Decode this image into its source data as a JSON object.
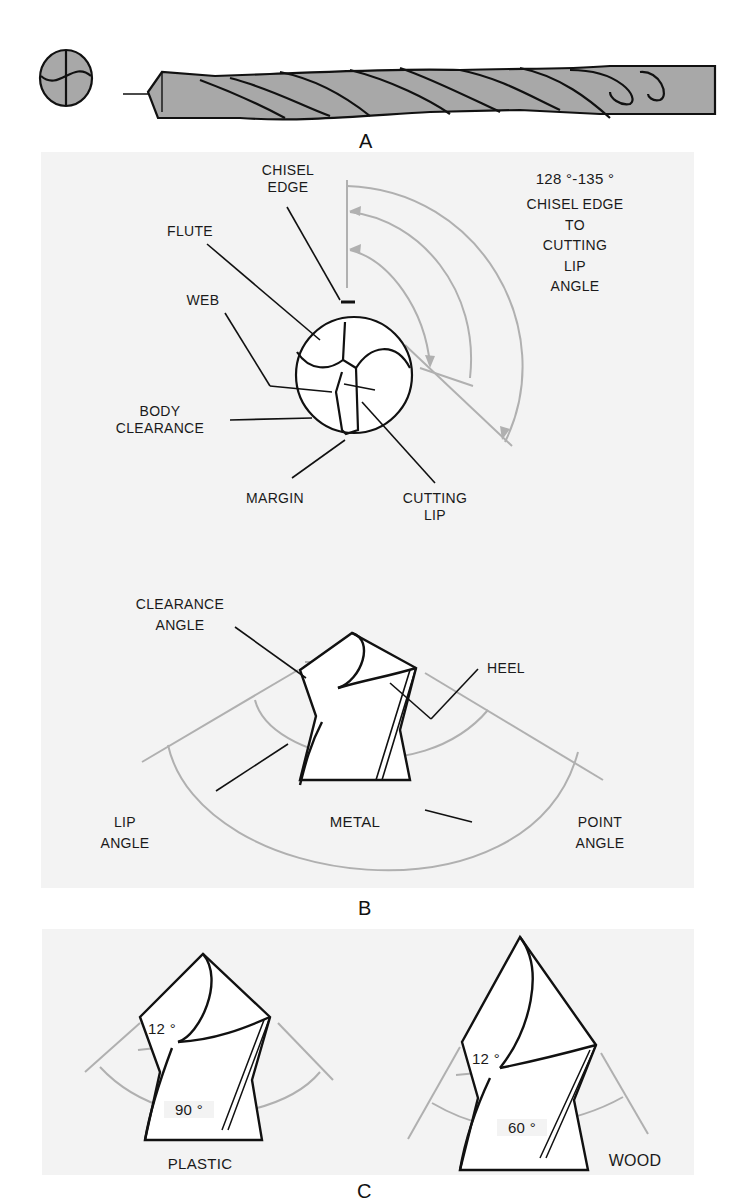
{
  "figure_labels": {
    "a": "A",
    "b": "B",
    "c": "C"
  },
  "panel_b": {
    "end_view": {
      "chisel_edge": "CHISEL\nEDGE",
      "flute": "FLUTE",
      "web": "WEB",
      "body_clearance": "BODY\nCLEARANCE",
      "margin": "MARGIN",
      "cutting_lip": "CUTTING\nLIP",
      "angle_range": "128 °-135 °",
      "angle_caption": "CHISEL EDGE\nTO\nCUTTING\nLIP\nANGLE"
    },
    "side_view": {
      "clearance_angle": "CLEARANCE\nANGLE",
      "heel": "HEEL",
      "lip_angle": "LIP\nANGLE",
      "material": "METAL",
      "point_angle": "POINT\nANGLE"
    }
  },
  "panel_c": {
    "plastic": {
      "clearance": "12 °",
      "point": "90 °",
      "material": "PLASTIC"
    },
    "wood": {
      "clearance": "12 °",
      "point": "60 °",
      "material": "WOOD"
    }
  },
  "colors": {
    "panel_bg": "#f3f3f3",
    "drill_fill": "#a8a8a8",
    "dim_line": "#b0b0b0",
    "ink": "#1a1a1a"
  }
}
